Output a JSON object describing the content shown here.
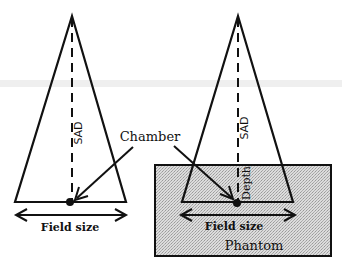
{
  "diagram": {
    "type": "radiotherapy-geometry",
    "left_setup": {
      "axis_label": "SAD",
      "field_label": "Field size"
    },
    "right_setup": {
      "axis_label": "SAD",
      "depth_label": "Depth",
      "field_label": "Field size",
      "phantom_label": "Phantom"
    },
    "shared_label": "Chamber",
    "colors": {
      "line": "#111111",
      "phantom_fill": "#d6d6d6",
      "background": "#ffffff",
      "band": "#ededed"
    }
  }
}
